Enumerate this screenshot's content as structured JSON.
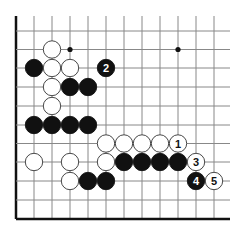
{
  "diagram": {
    "type": "go-board-fragment",
    "grid": {
      "columns": 12,
      "rows": 11,
      "col_x": [
        16,
        34,
        52,
        70,
        88,
        106,
        124,
        142,
        160,
        178,
        196,
        214
      ],
      "row_y": [
        31,
        49.5,
        68,
        87,
        106,
        125,
        143.5,
        162,
        181,
        200,
        219
      ],
      "top_open_y": 16,
      "right_open_x": 230,
      "left_edge": true,
      "bottom_edge": true,
      "line_color": "#888888",
      "edge_color": "#111111"
    },
    "star_points": [
      {
        "col": 3,
        "row": 1
      },
      {
        "col": 9,
        "row": 1
      }
    ],
    "stones": [
      {
        "color": "white",
        "col": 2,
        "row": 1
      },
      {
        "color": "black",
        "col": 1,
        "row": 2
      },
      {
        "color": "white",
        "col": 2,
        "row": 2
      },
      {
        "color": "white",
        "col": 3,
        "row": 2
      },
      {
        "color": "black",
        "col": 5,
        "row": 2,
        "label": "2"
      },
      {
        "color": "white",
        "col": 2,
        "row": 3
      },
      {
        "color": "black",
        "col": 3,
        "row": 3
      },
      {
        "color": "black",
        "col": 4,
        "row": 3
      },
      {
        "color": "white",
        "col": 2,
        "row": 4
      },
      {
        "color": "black",
        "col": 1,
        "row": 5
      },
      {
        "color": "black",
        "col": 2,
        "row": 5
      },
      {
        "color": "black",
        "col": 3,
        "row": 5
      },
      {
        "color": "black",
        "col": 4,
        "row": 5
      },
      {
        "color": "white",
        "col": 5,
        "row": 6
      },
      {
        "color": "white",
        "col": 6,
        "row": 6
      },
      {
        "color": "white",
        "col": 7,
        "row": 6
      },
      {
        "color": "white",
        "col": 8,
        "row": 6
      },
      {
        "color": "white",
        "col": 9,
        "row": 6,
        "label": "1"
      },
      {
        "color": "white",
        "col": 1,
        "row": 7
      },
      {
        "color": "white",
        "col": 3,
        "row": 7
      },
      {
        "color": "white",
        "col": 5,
        "row": 7
      },
      {
        "color": "black",
        "col": 6,
        "row": 7
      },
      {
        "color": "black",
        "col": 7,
        "row": 7
      },
      {
        "color": "black",
        "col": 8,
        "row": 7
      },
      {
        "color": "black",
        "col": 9,
        "row": 7
      },
      {
        "color": "white",
        "col": 10,
        "row": 7,
        "label": "3"
      },
      {
        "color": "white",
        "col": 3,
        "row": 8
      },
      {
        "color": "black",
        "col": 4,
        "row": 8
      },
      {
        "color": "black",
        "col": 5,
        "row": 8
      },
      {
        "color": "black",
        "col": 10,
        "row": 8,
        "label": "4"
      },
      {
        "color": "white",
        "col": 11,
        "row": 8,
        "label": "5"
      }
    ],
    "colors": {
      "black_stone": "#111111",
      "white_stone": "#ffffff",
      "white_stone_border": "#333333",
      "star_point": "#111111"
    }
  }
}
